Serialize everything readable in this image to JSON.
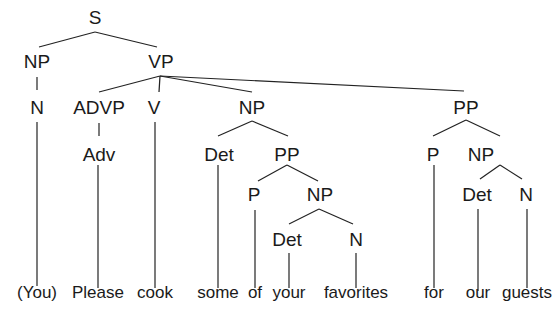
{
  "diagram": {
    "type": "syntax-tree",
    "sentence": "(You) Please cook some of your favorites for our guests",
    "nodes": [
      {
        "id": "s",
        "label": "S",
        "x": 95,
        "y": 24
      },
      {
        "id": "np1",
        "label": "NP",
        "x": 37,
        "y": 68
      },
      {
        "id": "vp",
        "label": "VP",
        "x": 161,
        "y": 68
      },
      {
        "id": "n1",
        "label": "N",
        "x": 37,
        "y": 114
      },
      {
        "id": "advp",
        "label": "ADVP",
        "x": 99,
        "y": 114
      },
      {
        "id": "v",
        "label": "V",
        "x": 154,
        "y": 114
      },
      {
        "id": "np2",
        "label": "NP",
        "x": 252,
        "y": 114
      },
      {
        "id": "pp1",
        "label": "PP",
        "x": 466,
        "y": 114
      },
      {
        "id": "adv",
        "label": "Adv",
        "x": 99,
        "y": 161
      },
      {
        "id": "det1",
        "label": "Det",
        "x": 219,
        "y": 161
      },
      {
        "id": "pp2",
        "label": "PP",
        "x": 287,
        "y": 161
      },
      {
        "id": "p1",
        "label": "P",
        "x": 433,
        "y": 161
      },
      {
        "id": "np3",
        "label": "NP",
        "x": 481,
        "y": 161
      },
      {
        "id": "p2",
        "label": "P",
        "x": 254,
        "y": 201
      },
      {
        "id": "np4",
        "label": "NP",
        "x": 320,
        "y": 201
      },
      {
        "id": "det3",
        "label": "Det",
        "x": 477,
        "y": 201
      },
      {
        "id": "n3",
        "label": "N",
        "x": 526,
        "y": 201
      },
      {
        "id": "det2",
        "label": "Det",
        "x": 287,
        "y": 246
      },
      {
        "id": "n2",
        "label": "N",
        "x": 356,
        "y": 246
      }
    ],
    "words": [
      {
        "id": "w1",
        "label": "(You)",
        "x": 37,
        "y": 298
      },
      {
        "id": "w2",
        "label": "Please",
        "x": 98,
        "y": 298
      },
      {
        "id": "w3",
        "label": "cook",
        "x": 155,
        "y": 298
      },
      {
        "id": "w4",
        "label": "some",
        "x": 218,
        "y": 298
      },
      {
        "id": "w5",
        "label": "of",
        "x": 255,
        "y": 298
      },
      {
        "id": "w6",
        "label": "your",
        "x": 289,
        "y": 298
      },
      {
        "id": "w7",
        "label": "favorites",
        "x": 356,
        "y": 298
      },
      {
        "id": "w8",
        "label": "for",
        "x": 434,
        "y": 298
      },
      {
        "id": "w9",
        "label": "our",
        "x": 478,
        "y": 298
      },
      {
        "id": "w10",
        "label": "guests",
        "x": 527,
        "y": 298
      }
    ],
    "edges": [
      {
        "from": "S",
        "to": "NP",
        "x1": 95,
        "y1": 32,
        "x2": 39,
        "y2": 47
      },
      {
        "from": "S",
        "to": "VP",
        "x1": 95,
        "y1": 32,
        "x2": 157,
        "y2": 47
      },
      {
        "from": "NP",
        "to": "N",
        "x1": 37,
        "y1": 77,
        "x2": 37,
        "y2": 90
      },
      {
        "from": "VP",
        "to": "ADVP",
        "x1": 160,
        "y1": 76,
        "x2": 99,
        "y2": 92
      },
      {
        "from": "VP",
        "to": "V",
        "x1": 160,
        "y1": 76,
        "x2": 159,
        "y2": 92
      },
      {
        "from": "VP",
        "to": "NP",
        "x1": 160,
        "y1": 76,
        "x2": 252,
        "y2": 92
      },
      {
        "from": "VP",
        "to": "PP",
        "x1": 160,
        "y1": 76,
        "x2": 464,
        "y2": 91
      },
      {
        "from": "ADVP",
        "to": "Adv",
        "x1": 99,
        "y1": 123,
        "x2": 99,
        "y2": 136
      },
      {
        "from": "NP",
        "to": "Det",
        "x1": 252,
        "y1": 121,
        "x2": 218,
        "y2": 136
      },
      {
        "from": "NP",
        "to": "PP",
        "x1": 252,
        "y1": 121,
        "x2": 288,
        "y2": 136
      },
      {
        "from": "PP",
        "to": "P",
        "x1": 466,
        "y1": 120,
        "x2": 433,
        "y2": 136
      },
      {
        "from": "PP",
        "to": "NP",
        "x1": 466,
        "y1": 120,
        "x2": 500,
        "y2": 136
      },
      {
        "from": "PP",
        "to": "P",
        "x1": 287,
        "y1": 165,
        "x2": 258,
        "y2": 181
      },
      {
        "from": "PP",
        "to": "NP",
        "x1": 287,
        "y1": 165,
        "x2": 318,
        "y2": 181
      },
      {
        "from": "NP",
        "to": "Det",
        "x1": 500,
        "y1": 165,
        "x2": 480,
        "y2": 179
      },
      {
        "from": "NP",
        "to": "N",
        "x1": 500,
        "y1": 165,
        "x2": 522,
        "y2": 179
      },
      {
        "from": "NP",
        "to": "Det",
        "x1": 319,
        "y1": 209,
        "x2": 289,
        "y2": 224
      },
      {
        "from": "NP",
        "to": "N",
        "x1": 319,
        "y1": 209,
        "x2": 353,
        "y2": 224
      },
      {
        "from": "N",
        "to": "(You)",
        "x1": 37,
        "y1": 122,
        "x2": 37,
        "y2": 286
      },
      {
        "from": "Adv",
        "to": "Please",
        "x1": 98,
        "y1": 165,
        "x2": 98,
        "y2": 288
      },
      {
        "from": "V",
        "to": "cook",
        "x1": 155,
        "y1": 122,
        "x2": 155,
        "y2": 288
      },
      {
        "from": "Det",
        "to": "some",
        "x1": 218,
        "y1": 165,
        "x2": 218,
        "y2": 288
      },
      {
        "from": "P",
        "to": "of",
        "x1": 255,
        "y1": 210,
        "x2": 255,
        "y2": 288
      },
      {
        "from": "Det",
        "to": "your",
        "x1": 289,
        "y1": 253,
        "x2": 289,
        "y2": 288
      },
      {
        "from": "N",
        "to": "favorites",
        "x1": 356,
        "y1": 253,
        "x2": 356,
        "y2": 288
      },
      {
        "from": "P",
        "to": "for",
        "x1": 434,
        "y1": 165,
        "x2": 434,
        "y2": 288
      },
      {
        "from": "Det",
        "to": "our",
        "x1": 478,
        "y1": 209,
        "x2": 478,
        "y2": 291
      },
      {
        "from": "N",
        "to": "guests",
        "x1": 527,
        "y1": 209,
        "x2": 527,
        "y2": 288
      }
    ]
  }
}
